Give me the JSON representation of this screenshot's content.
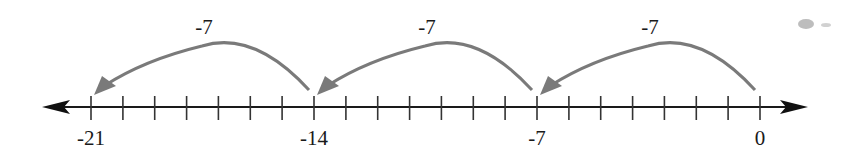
{
  "diagram": {
    "type": "number-line",
    "axis": {
      "min": -21,
      "max": 0,
      "tick_step": 1,
      "labeled_ticks": [
        {
          "value": -21,
          "label": "-21"
        },
        {
          "value": -14,
          "label": "-14"
        },
        {
          "value": -7,
          "label": "-7"
        },
        {
          "value": 0,
          "label": "0"
        }
      ],
      "arrows": "both",
      "color": "#1a1a1a"
    },
    "jumps": [
      {
        "from": 0,
        "to": -7,
        "label": "-7"
      },
      {
        "from": -7,
        "to": -14,
        "label": "-7"
      },
      {
        "from": -14,
        "to": -21,
        "label": "-7"
      }
    ],
    "jump_color": "#7a7a7a"
  }
}
